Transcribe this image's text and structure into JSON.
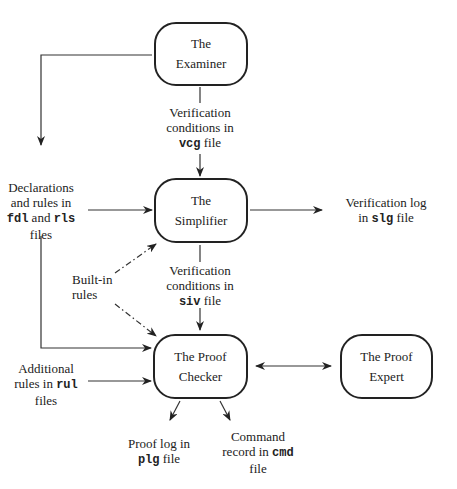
{
  "nodes": {
    "examiner": {
      "line1": "The",
      "line2": "Examiner"
    },
    "simplifier": {
      "line1": "The",
      "line2": "Simplifier"
    },
    "checker": {
      "line1": "The Proof",
      "line2": "Checker"
    },
    "expert": {
      "line1": "The Proof",
      "line2": "Expert"
    }
  },
  "labels": {
    "vcg": {
      "line1": "Verification",
      "line2": "conditions in",
      "code": "vcg",
      "suffix": " file"
    },
    "fdl": {
      "line1": "Declarations",
      "line2": "and rules in",
      "code1": "fdl",
      "mid": " and ",
      "code2": "rls",
      "line4": "files"
    },
    "slg": {
      "line1": "Verification log",
      "prefix": "in ",
      "code": "slg",
      "suffix": " file"
    },
    "builtin": {
      "line1": "Built-in",
      "line2": "rules"
    },
    "siv": {
      "line1": "Verification",
      "line2": "conditions in",
      "code": "siv",
      "suffix": " file"
    },
    "rul": {
      "line1": "Additional",
      "prefix": "rules in ",
      "code": "rul",
      "line3": "files"
    },
    "plg": {
      "line1": "Proof log in",
      "code": "plg",
      "suffix": " file"
    },
    "cmd": {
      "line1": "Command",
      "prefix": "record in ",
      "code": "cmd",
      "line3": "file"
    }
  }
}
